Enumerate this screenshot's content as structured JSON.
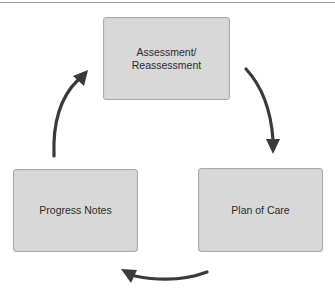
{
  "diagram": {
    "title": "",
    "type": "cycle",
    "nodes": [
      {
        "id": "assessment",
        "label_line1": "Assessment/",
        "label_line2": "Reassessment"
      },
      {
        "id": "plan",
        "label": "Plan of Care"
      },
      {
        "id": "progress",
        "label": "Progress Notes"
      }
    ],
    "edges": [
      {
        "from": "Assessment/Reassessment",
        "to": "Plan of Care",
        "direction": "clockwise"
      },
      {
        "from": "Plan of Care",
        "to": "Progress Notes",
        "direction": "clockwise"
      },
      {
        "from": "Progress Notes",
        "to": "Assessment/Reassessment",
        "direction": "clockwise"
      }
    ],
    "colors": {
      "box_fill": "#d8d8d8",
      "box_border": "#a9a9a9",
      "arrow": "#3a3a3a",
      "text": "#2b2b2b"
    }
  }
}
